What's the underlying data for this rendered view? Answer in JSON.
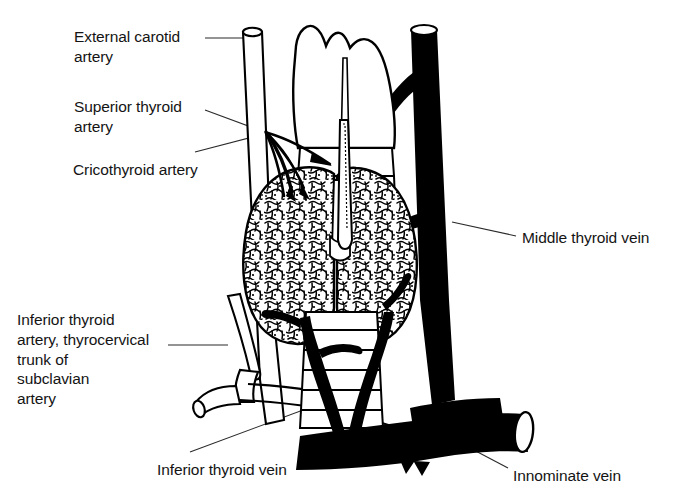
{
  "figure": {
    "title": "Arterial and venous supply of the thyroid gland",
    "style": "black-and-white line drawing",
    "background_color": "#ffffff",
    "ink_color": "#000000",
    "text_color": "#141414"
  },
  "labels": {
    "external_carotid_artery": "External carotid\nartery",
    "superior_thyroid_artery": "Superior thyroid\nartery",
    "cricothyroid_artery": "Cricothyroid artery",
    "middle_thyroid_vein": "Middle thyroid vein",
    "inferior_thyroid_artery": "Inferior thyroid\nartery, thyrocervical\ntrunk of\nsubclavian\nartery",
    "inferior_thyroid_vein": "Inferior thyroid vein",
    "innominate_vein": "Innominate vein"
  },
  "structures": [
    {
      "name": "thyroid-cartilage",
      "rendering": "white outline",
      "position": "top-center"
    },
    {
      "name": "trachea",
      "rendering": "white outline with cartilage rings",
      "position": "center"
    },
    {
      "name": "thyroid-gland-left-lobe",
      "rendering": "stippled lobular texture",
      "position": "center-left"
    },
    {
      "name": "thyroid-gland-right-lobe",
      "rendering": "stippled lobular texture",
      "position": "center-right"
    },
    {
      "name": "external-carotid-artery",
      "rendering": "white outlined tube",
      "position": "left"
    },
    {
      "name": "superior-thyroid-artery",
      "rendering": "thin black branches",
      "position": "upper-left-of-gland"
    },
    {
      "name": "cricothyroid-artery",
      "rendering": "thin black branch",
      "position": "upper-mid-left"
    },
    {
      "name": "inferior-thyroid-artery",
      "rendering": "white outlined tube",
      "position": "lower-left"
    },
    {
      "name": "thyrocervical-trunk",
      "rendering": "white outlined tube",
      "position": "lower-left"
    },
    {
      "name": "subclavian-artery",
      "rendering": "white outlined tube",
      "position": "lower-left"
    },
    {
      "name": "internal-jugular-vein",
      "rendering": "solid black tube",
      "position": "right"
    },
    {
      "name": "middle-thyroid-vein",
      "rendering": "solid black branch",
      "position": "right-of-gland"
    },
    {
      "name": "inferior-thyroid-vein",
      "rendering": "solid black branches",
      "position": "lower-center"
    },
    {
      "name": "innominate-vein",
      "rendering": "solid black horizontal trunk",
      "position": "bottom"
    }
  ]
}
